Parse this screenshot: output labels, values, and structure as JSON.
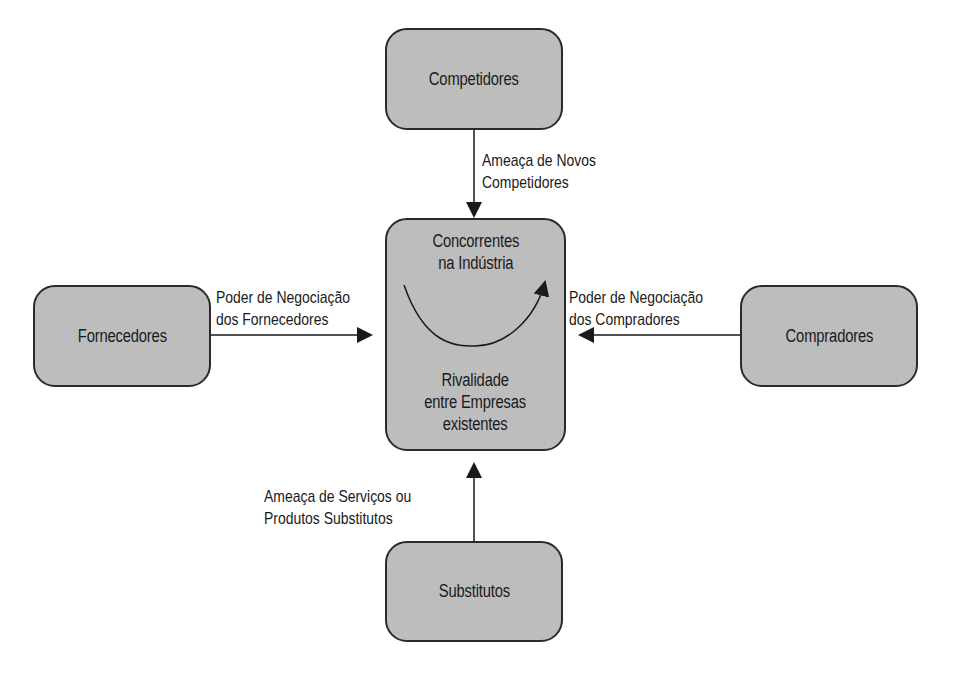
{
  "diagram": {
    "type": "porter-five-forces",
    "nodes": {
      "top": {
        "label": "Competidores"
      },
      "left": {
        "label": "Fornecedores"
      },
      "right": {
        "label": "Compradores"
      },
      "bottom": {
        "label": "Substitutos"
      },
      "center": {
        "top_label_line1": "Concorrentes",
        "top_label_line2": "na Indústria",
        "bottom_label_line1": "Rivalidade",
        "bottom_label_line2": "entre Empresas",
        "bottom_label_line3": "existentes"
      }
    },
    "edges": {
      "top_to_center": {
        "line1": "Ameaça de Novos",
        "line2": "Competidores"
      },
      "left_to_center": {
        "line1": "Poder de Negociação",
        "line2": "dos Fornecedores"
      },
      "right_to_center": {
        "line1": "Poder de Negociação",
        "line2": "dos Compradores"
      },
      "bottom_to_center": {
        "line1": "Ameaça de Serviços ou",
        "line2": "Produtos Substitutos"
      }
    },
    "colors": {
      "box_fill": "#bdbdbd",
      "stroke": "#2a2a2a",
      "background": "#ffffff"
    }
  }
}
